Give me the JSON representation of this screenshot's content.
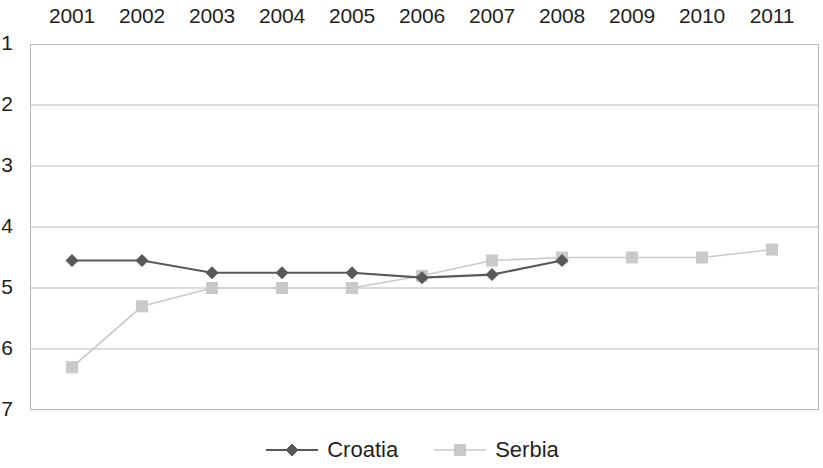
{
  "chart_data": {
    "type": "line",
    "title": "",
    "xlabel": "",
    "ylabel": "",
    "x": [
      2001,
      2002,
      2003,
      2004,
      2005,
      2006,
      2007,
      2008,
      2009,
      2010,
      2011
    ],
    "xtick_labels": [
      "2001",
      "2002",
      "2003",
      "2004",
      "2005",
      "2006",
      "2007",
      "2008",
      "2009",
      "2010",
      "2011"
    ],
    "ytick_labels": [
      "1",
      "2",
      "3",
      "4",
      "5",
      "6",
      "7"
    ],
    "ytick_values": [
      1,
      2,
      3,
      4,
      5,
      6,
      7
    ],
    "ylim": [
      1,
      7
    ],
    "y_axis_inverted": true,
    "y_axis_labels_clipped_at_left_edge": true,
    "xlim": [
      2001,
      2011
    ],
    "grid": true,
    "grid_axis": "y",
    "legend_position": "bottom-center",
    "series": [
      {
        "name": "Croatia",
        "color": "#58585a",
        "marker": "diamond",
        "x": [
          2001,
          2002,
          2003,
          2004,
          2005,
          2006,
          2007,
          2008
        ],
        "values": [
          4.55,
          4.55,
          4.75,
          4.75,
          4.75,
          4.83,
          4.78,
          4.55
        ]
      },
      {
        "name": "Serbia",
        "color": "#c9c9c9",
        "marker": "square",
        "x": [
          2001,
          2002,
          2003,
          2004,
          2005,
          2006,
          2007,
          2008,
          2009,
          2010,
          2011
        ],
        "values": [
          6.3,
          5.3,
          5.0,
          5.0,
          5.0,
          4.8,
          4.55,
          4.5,
          4.5,
          4.5,
          4.37
        ]
      }
    ]
  },
  "legend": {
    "items": [
      {
        "label": "Croatia",
        "color": "#58585a",
        "marker": "diamond"
      },
      {
        "label": "Serbia",
        "color": "#c9c9c9",
        "marker": "square"
      }
    ]
  },
  "colors": {
    "croatia": "#58585a",
    "serbia": "#c9c9c9",
    "grid": "#b9b9b9",
    "text": "#231f20",
    "background": "#ffffff"
  }
}
